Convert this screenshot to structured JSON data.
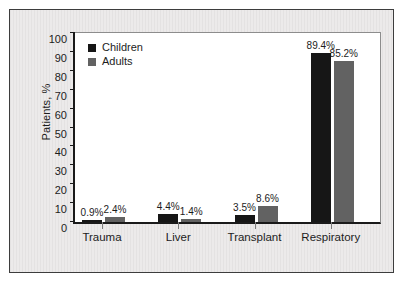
{
  "chart_data": {
    "type": "bar",
    "title": "",
    "xlabel": "",
    "ylabel": "Patients, %",
    "ylim": [
      0,
      100
    ],
    "yticks": [
      0,
      10,
      20,
      30,
      40,
      50,
      60,
      70,
      80,
      90,
      100
    ],
    "grid": false,
    "legend_position": "top-left",
    "categories": [
      "Trauma",
      "Liver",
      "Transplant",
      "Respiratory"
    ],
    "series": [
      {
        "name": "Children",
        "color": "#161616",
        "values": [
          0.9,
          4.4,
          3.5,
          89.4
        ],
        "labels": [
          "0.9%",
          "4.4%",
          "3.5%",
          "89.4%"
        ]
      },
      {
        "name": "Adults",
        "color": "#626262",
        "values": [
          2.4,
          1.4,
          8.6,
          85.2
        ],
        "labels": [
          "2.4%",
          "1.4%",
          "8.6%",
          "85.2%"
        ]
      }
    ]
  },
  "colors": {
    "children": "#161616",
    "adults": "#626262",
    "axis": "#1a1a1a",
    "figure_background": "#eceaea",
    "plot_background": "#ffffff",
    "frame_border": "#3d3d3d"
  }
}
